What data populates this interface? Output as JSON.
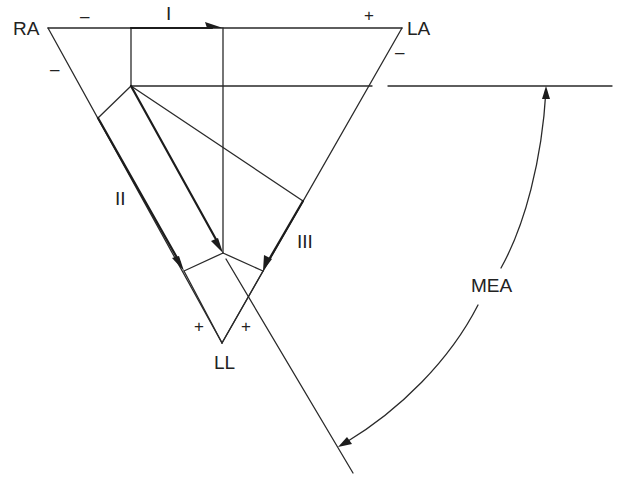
{
  "diagram": {
    "vertices": [
      {
        "id": "RA",
        "label": "RA"
      },
      {
        "id": "LA",
        "label": "LA"
      },
      {
        "id": "LL",
        "label": "LL"
      }
    ],
    "leads": [
      {
        "id": "I",
        "label": "I",
        "from": "RA",
        "to": "LA"
      },
      {
        "id": "II",
        "label": "II",
        "from": "RA",
        "to": "LL"
      },
      {
        "id": "III",
        "label": "III",
        "from": "LA",
        "to": "LL"
      }
    ],
    "polarity_signs": {
      "lead_I_negative": "–",
      "lead_I_positive": "+",
      "lead_II_negative": "–",
      "lead_II_positive": "+",
      "lead_III_negative": "–",
      "lead_III_positive": "+"
    },
    "angle_label": "MEA",
    "colors": {
      "line": "#2a2a2a",
      "text": "#222222",
      "background": "#ffffff"
    }
  }
}
